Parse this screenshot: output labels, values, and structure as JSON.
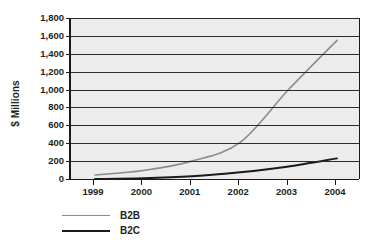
{
  "chart_data": {
    "type": "line",
    "title": "",
    "xlabel": "",
    "ylabel": "$ Millions",
    "x": [
      "1999",
      "2000",
      "2001",
      "2002",
      "2003",
      "2004"
    ],
    "categories": [
      "1999",
      "2000",
      "2001",
      "2002",
      "2003",
      "2004"
    ],
    "xtick_labels": [
      "1999",
      "2000",
      "2001",
      "2002",
      "2003",
      "2004"
    ],
    "ytick_labels": [
      "0",
      "200",
      "400",
      "600",
      "800",
      "1,000",
      "1,200",
      "1,400",
      "1,600",
      "1,800"
    ],
    "ytick_values": [
      0,
      200,
      400,
      600,
      800,
      1000,
      1200,
      1400,
      1600,
      1800
    ],
    "ylim": [
      0,
      1800
    ],
    "grid": "horizontal",
    "legend_position": "bottom-left",
    "series": [
      {
        "name": "B2B",
        "color": "#8c8c8c",
        "values": [
          45,
          95,
          200,
          410,
          1000,
          1550
        ]
      },
      {
        "name": "B2C",
        "color": "#1a1a1a",
        "values": [
          0,
          8,
          30,
          75,
          140,
          230
        ]
      }
    ]
  },
  "axis": {
    "y_title": "$ Millions"
  },
  "legend": {
    "items": [
      {
        "label": "B2B",
        "color": "#8c8c8c"
      },
      {
        "label": "B2C",
        "color": "#1a1a1a"
      }
    ]
  }
}
